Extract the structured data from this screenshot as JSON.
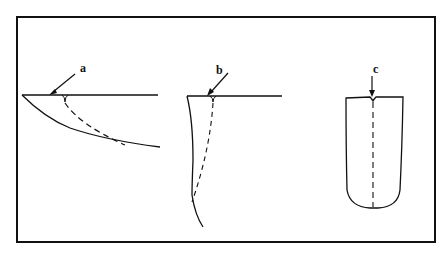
{
  "diagram": {
    "colors": {
      "stroke": "#111111",
      "background": "#ffffff"
    },
    "panels": [
      {
        "id": "a",
        "label": "a",
        "shape": "shallow inclined crack with dashed branch"
      },
      {
        "id": "b",
        "label": "b",
        "shape": "deep narrow crack with dashed branch"
      },
      {
        "id": "c",
        "label": "c",
        "shape": "U-shaped profile with vertical dashed centerline"
      }
    ]
  }
}
